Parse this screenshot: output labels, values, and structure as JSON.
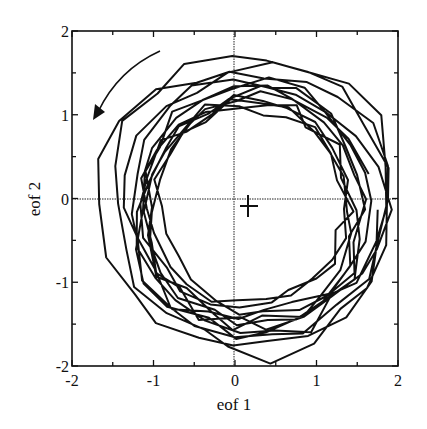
{
  "chart_data": {
    "type": "line",
    "title": "",
    "xlabel": "eof 1",
    "ylabel": "eof 2",
    "xlim": [
      -2,
      2
    ],
    "ylim": [
      -2,
      2
    ],
    "xticks": [
      "-2",
      "-1",
      "0",
      "1",
      "2"
    ],
    "yticks": [
      "-2",
      "-1",
      "0",
      "1",
      "2"
    ],
    "grid": false,
    "zero_lines": true,
    "legend": null,
    "annotations": [
      {
        "type": "arrow",
        "description": "curved arrow indicating counter-clockwise rotation",
        "from": [
          -0.9,
          1.8
        ],
        "to": [
          -1.7,
          0.95
        ]
      },
      {
        "type": "cross-marker",
        "description": "mean / origin marker",
        "x": 0.18,
        "y": -0.1
      }
    ],
    "series": [
      {
        "name": "trajectory",
        "description": "EOF phase-space trajectory forming ~12 counter-clockwise loops of radius ~1.4-1.9 centered near (0.2, -0.1)",
        "loops": 12,
        "center": [
          0.2,
          -0.1
        ],
        "radius_range": [
          1.15,
          1.9
        ]
      }
    ]
  }
}
